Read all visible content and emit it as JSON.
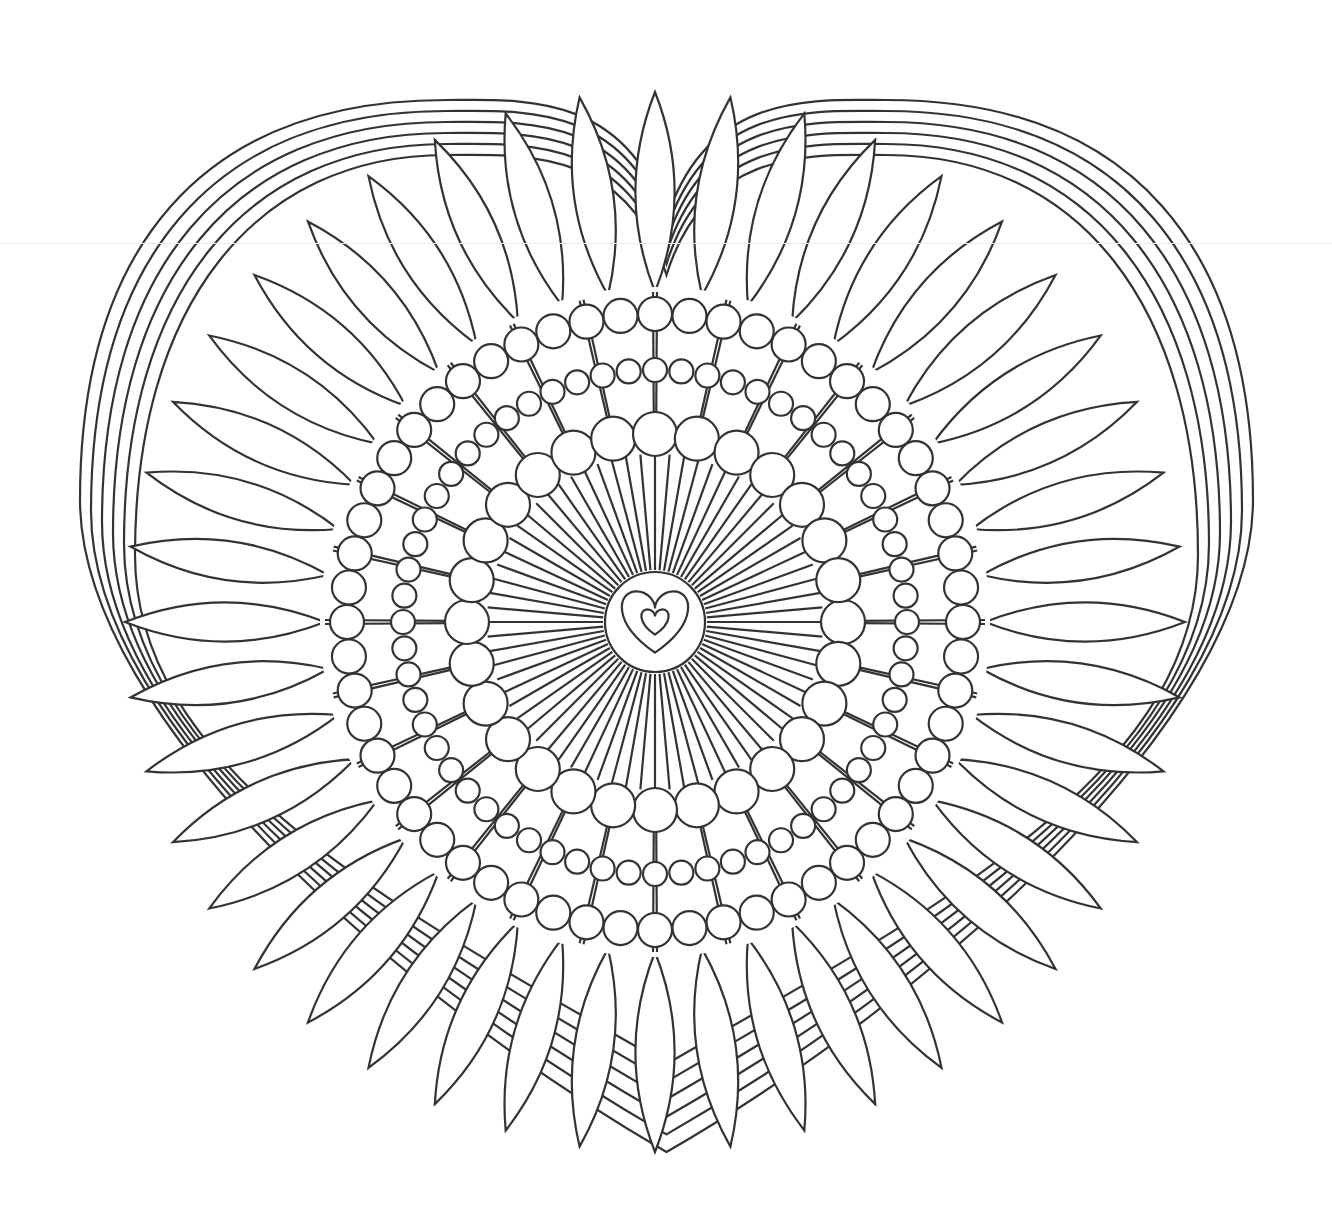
{
  "page": {
    "background": "#ffffff",
    "line_color": "#333333"
  },
  "design": {
    "center": [
      655,
      622
    ],
    "heart_outline": {
      "strokes": 6,
      "spacing": 11,
      "left_edge_x": 80,
      "right_edge_x": 1253,
      "top_y": 100,
      "bottom_point": [
        655,
        1152
      ]
    },
    "petals": {
      "count": 44,
      "inner_radius": 330,
      "outer_radius": 530,
      "half_width": 28
    },
    "bead_rings": [
      {
        "name": "outer-bead-ring",
        "radius": 308,
        "bead_radius": 17,
        "count": 56
      },
      {
        "name": "middle-bead-ring",
        "radius": 252,
        "bead_radius": 12,
        "count": 60
      },
      {
        "name": "inner-bead-ring",
        "radius": 188,
        "bead_radius": 22,
        "count": 28
      }
    ],
    "rays": {
      "count": 72,
      "inner_radius": 52,
      "outer_radius": 168
    },
    "center_medallion": {
      "radius": 50,
      "large_heart_size": 34,
      "small_heart_size": 14
    }
  }
}
